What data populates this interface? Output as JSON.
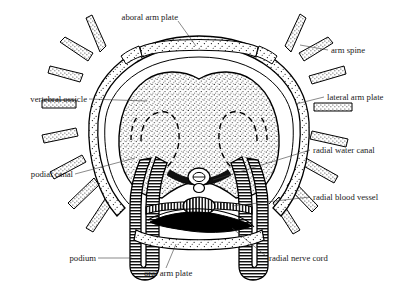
{
  "figure": {
    "style": "black-and-white stippled line drawing",
    "background_color": "#ffffff",
    "ink_color": "#000000"
  },
  "labels": [
    {
      "id": "aboral-arm-plate",
      "text": "aboral arm plate",
      "side": "top",
      "x": 116,
      "y": 17,
      "leader": [
        [
          178,
          21
        ],
        [
          196,
          46
        ]
      ]
    },
    {
      "id": "arm-spine",
      "text": "arm spine",
      "side": "right",
      "x": 331,
      "y": 53,
      "leader": [
        [
          328,
          50
        ],
        [
          300,
          45
        ]
      ]
    },
    {
      "id": "lateral-arm-plate",
      "text": "lateral arm plate",
      "side": "right",
      "x": 327,
      "y": 100,
      "leader": [
        [
          324,
          97
        ],
        [
          296,
          104
        ]
      ]
    },
    {
      "id": "vertebral-ossicle",
      "text": "vertebral ossicle",
      "side": "left",
      "x": 86,
      "y": 102,
      "leader": [
        [
          89,
          99
        ],
        [
          147,
          101
        ]
      ]
    },
    {
      "id": "podial-canal",
      "text": "podial canal",
      "side": "left",
      "x": 72,
      "y": 177,
      "leader": [
        [
          75,
          174
        ],
        [
          135,
          158
        ]
      ]
    },
    {
      "id": "radial-water-canal",
      "text": "radial water canal",
      "side": "right",
      "x": 313,
      "y": 153,
      "leader": [
        [
          310,
          150
        ],
        [
          213,
          180
        ]
      ]
    },
    {
      "id": "radial-blood-vessel",
      "text": "radial blood vessel",
      "side": "right",
      "x": 313,
      "y": 200,
      "leader": [
        [
          310,
          197
        ],
        [
          232,
          206
        ]
      ]
    },
    {
      "id": "radial-nerve-cord",
      "text": "radial nerve cord",
      "side": "right",
      "x": 269,
      "y": 259,
      "leader": [
        [
          266,
          256
        ],
        [
          232,
          228
        ]
      ]
    },
    {
      "id": "podium",
      "text": "podium",
      "side": "left",
      "x": 95,
      "y": 261,
      "leader": [
        [
          98,
          258
        ],
        [
          132,
          258
        ]
      ]
    },
    {
      "id": "oral-arm-plate",
      "text": "oral arm plate",
      "side": "bottom",
      "x": 144,
      "y": 274,
      "leader": [
        [
          166,
          268
        ],
        [
          176,
          244
        ]
      ]
    }
  ],
  "structures": {
    "aboral_arm_plate": {
      "name": "aboral arm plate",
      "fill": "stipple",
      "position": "dorsal outer band"
    },
    "lateral_arm_plate": {
      "name": "lateral arm plate",
      "fill": "stipple",
      "position": "lateral outer ring"
    },
    "oral_arm_plate": {
      "name": "oral arm plate",
      "fill": "stipple",
      "position": "ventral band"
    },
    "vertebral_ossicle": {
      "name": "vertebral ossicle",
      "fill": "dense stipple",
      "position": "central mass"
    },
    "arm_spines": {
      "name": "arm spine",
      "count": 14,
      "fill": "stipple",
      "shape": "tapered"
    },
    "podia": {
      "name": "podium",
      "count": 2,
      "fill": "banded",
      "shape": "elongated tube"
    },
    "radial_water_canal": {
      "name": "radial water canal",
      "shape": "small oval with lateral wings"
    },
    "radial_blood_vessel": {
      "name": "radial blood vessel",
      "shape": "banded horizontal tube with central swelling"
    },
    "radial_nerve_cord": {
      "name": "radial nerve cord",
      "shape": "solid black lens",
      "fill": "#000000"
    },
    "podial_canal": {
      "name": "podial canal",
      "shape": "dashed curved ducts",
      "stroke": "dashed"
    }
  }
}
